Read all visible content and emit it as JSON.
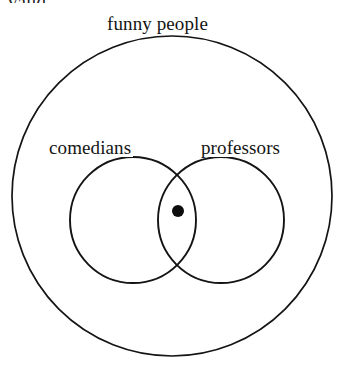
{
  "diagram": {
    "type": "euler-venn",
    "background_color": "#ffffff",
    "stroke_color": "#141414",
    "cut_off_caption": "valid.",
    "universe": {
      "label": "funny people",
      "shape": "circle",
      "center_x": 172,
      "center_y": 196,
      "radius": 160
    },
    "sets": [
      {
        "label": "comedians",
        "shape": "circle",
        "center_x": 133,
        "center_y": 220,
        "radius": 63
      },
      {
        "label": "professors",
        "shape": "circle",
        "center_x": 221,
        "center_y": 220,
        "radius": 63
      }
    ],
    "marks": [
      {
        "name": "individual-dot",
        "shape": "filled-circle",
        "center_x": 178,
        "center_y": 211,
        "radius": 6,
        "region": "intersection-of-comedians-and-professors"
      }
    ]
  }
}
